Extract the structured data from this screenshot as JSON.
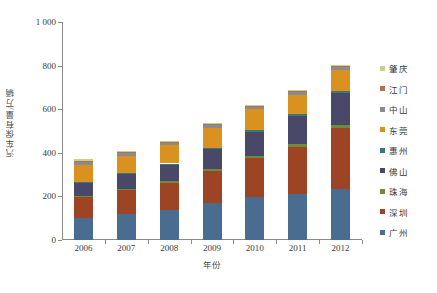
{
  "chart_data": {
    "type": "bar",
    "stacked": true,
    "title": "",
    "xlabel": "年份",
    "ylabel": "汽车保有量/万辆",
    "categories": [
      "2006",
      "2007",
      "2008",
      "2009",
      "2010",
      "2011",
      "2012"
    ],
    "ylim": [
      0,
      1000
    ],
    "yticks": [
      0,
      200,
      400,
      600,
      800,
      1000
    ],
    "ytick_labels": [
      "0",
      "200",
      "400",
      "600",
      "800",
      "1 000"
    ],
    "grid": false,
    "legend_position": "right",
    "stack_order_bottom_to_top": [
      "广州",
      "深圳",
      "珠海",
      "佛山",
      "惠州",
      "东莞",
      "中山",
      "江门",
      "肇庆"
    ],
    "series": [
      {
        "name": "广州",
        "color": "#4a6c90",
        "values": [
          102,
          118,
          136,
          168,
          196,
          212,
          232
        ]
      },
      {
        "name": "深圳",
        "color": "#9c4423",
        "values": [
          96,
          110,
          126,
          148,
          178,
          216,
          280
        ]
      },
      {
        "name": "珠海",
        "color": "#6f8b3a",
        "values": [
          6,
          7,
          8,
          10,
          12,
          14,
          16
        ]
      },
      {
        "name": "佛山",
        "color": "#4a4868",
        "values": [
          58,
          66,
          76,
          92,
          110,
          126,
          146
        ]
      },
      {
        "name": "惠州",
        "color": "#3c7878",
        "values": [
          4,
          5,
          5,
          6,
          7,
          8,
          9
        ]
      },
      {
        "name": "东莞",
        "color": "#d99120",
        "values": [
          76,
          80,
          85,
          92,
          96,
          90,
          96
        ]
      },
      {
        "name": "中山",
        "color": "#8a8a94",
        "values": [
          14,
          12,
          10,
          10,
          11,
          12,
          13
        ],
        "note": "thin grey band near top of each bar"
      },
      {
        "name": "江门",
        "color": "#b5714a",
        "values": [
          8,
          8,
          6,
          6,
          7,
          8,
          9
        ]
      },
      {
        "name": "肇庆",
        "color": "#c8cf8a",
        "values": [
          6,
          4,
          3,
          3,
          3,
          4,
          4
        ]
      }
    ],
    "totals": [
      370,
      410,
      455,
      535,
      620,
      690,
      805
    ]
  },
  "legend": {
    "items": [
      {
        "label": "肇庆",
        "color": "#c8cf8a"
      },
      {
        "label": "江门",
        "color": "#b5714a"
      },
      {
        "label": "中山",
        "color": "#8a8a94"
      },
      {
        "label": "东莞",
        "color": "#d99120"
      },
      {
        "label": "惠州",
        "color": "#3c7878"
      },
      {
        "label": "佛山",
        "color": "#4a4868"
      },
      {
        "label": "珠海",
        "color": "#6f8b3a"
      },
      {
        "label": "深圳",
        "color": "#9c4423"
      },
      {
        "label": "广州",
        "color": "#4a6c90"
      }
    ]
  },
  "axes": {
    "y_title": "汽车保有量/万辆",
    "x_title": "年份"
  }
}
